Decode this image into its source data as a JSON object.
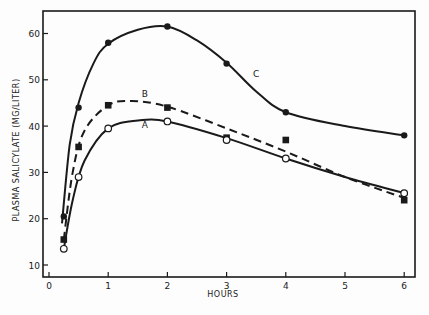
{
  "chart_data": {
    "type": "line",
    "title": "",
    "xlabel": "HOURS",
    "ylabel": "PLASMA SALICYLATE (MG/LITER)",
    "xlim": [
      0,
      6.2
    ],
    "ylim": [
      7.5,
      65
    ],
    "x_ticks": [
      0,
      1,
      2,
      3,
      4,
      5,
      6
    ],
    "x_tick_labels": [
      "0",
      "1",
      "2",
      "3",
      "4",
      "5",
      "6"
    ],
    "y_ticks": [
      10,
      20,
      30,
      40,
      50,
      60
    ],
    "y_tick_labels": [
      "10",
      "20",
      "30",
      "40",
      "50",
      "60"
    ],
    "grid": false,
    "legend": "inline labels on curves",
    "x": [
      0.25,
      0.5,
      1,
      2,
      3,
      4,
      6
    ],
    "series": [
      {
        "name": "C",
        "marker": "filled-circle",
        "line": "solid",
        "values": [
          20.5,
          44,
          58,
          61.5,
          53.5,
          43,
          38
        ],
        "curve": [
          [
            0.22,
            19
          ],
          [
            0.35,
            36
          ],
          [
            0.5,
            45
          ],
          [
            0.75,
            53.5
          ],
          [
            1,
            57.8
          ],
          [
            1.5,
            60.8
          ],
          [
            2,
            61.5
          ],
          [
            2.5,
            58.5
          ],
          [
            3,
            53.7
          ],
          [
            3.5,
            47.5
          ],
          [
            4,
            43
          ],
          [
            5,
            40
          ],
          [
            6,
            38
          ]
        ]
      },
      {
        "name": "B",
        "marker": "filled-square",
        "line": "dashed",
        "values": [
          15.5,
          35.5,
          44.5,
          44,
          37.5,
          37,
          24
        ],
        "curve": [
          [
            0.25,
            15.5
          ],
          [
            0.4,
            30
          ],
          [
            0.6,
            39
          ],
          [
            1,
            44.5
          ],
          [
            1.4,
            45.4
          ],
          [
            2,
            44.2
          ],
          [
            3,
            39.5
          ],
          [
            4,
            34.5
          ],
          [
            5,
            29
          ],
          [
            6,
            24.5
          ]
        ]
      },
      {
        "name": "A",
        "marker": "open-circle",
        "line": "solid",
        "values": [
          13.5,
          29,
          39.5,
          41,
          37,
          33,
          25.5
        ],
        "curve": [
          [
            0.25,
            13.5
          ],
          [
            0.4,
            24
          ],
          [
            0.6,
            32.5
          ],
          [
            1,
            39.5
          ],
          [
            1.5,
            41.2
          ],
          [
            2,
            41
          ],
          [
            3,
            37.4
          ],
          [
            4,
            33
          ],
          [
            5,
            29
          ],
          [
            6,
            25.5
          ]
        ]
      }
    ],
    "annotations": [
      {
        "text": "C",
        "x": 3.5,
        "y": 50.5
      },
      {
        "text": "B",
        "x": 1.62,
        "y": 46.3
      },
      {
        "text": "A",
        "x": 1.62,
        "y": 39.5
      }
    ]
  },
  "colors": {
    "ink": "#1a1a1a",
    "background": "#fdfdfd"
  }
}
